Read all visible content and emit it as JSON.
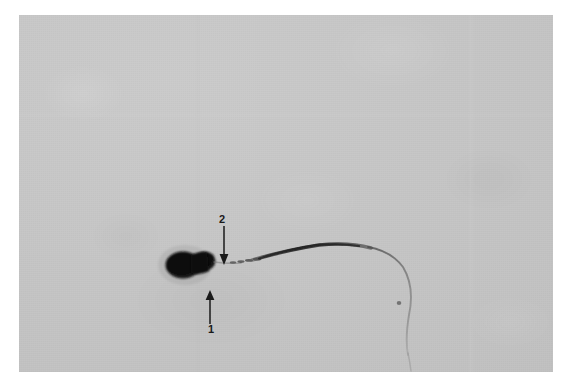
{
  "image": {
    "kind": "light-micrograph",
    "subject": "stained spermatozoon",
    "plate": {
      "left": 19,
      "top": 15,
      "width": 534,
      "height": 357,
      "background_color": "#c6c6c6",
      "page_color": "#ffffff"
    },
    "stain_color": "#111111",
    "annotation_color": "#1a1a1a"
  },
  "annotations": [
    {
      "id": "annotation-1",
      "label": "1",
      "arrow_direction": "up",
      "points_to": "sperm-head",
      "label_x": 189,
      "label_y": 309,
      "arrow_x": 184,
      "arrow_y": 275
    },
    {
      "id": "annotation-2",
      "label": "2",
      "arrow_direction": "down",
      "points_to": "sperm-midpiece",
      "label_x": 200,
      "label_y": 199,
      "arrow_x": 198,
      "arrow_y": 211
    }
  ],
  "cell": {
    "head_label": "sperm head",
    "midpiece_label": "sperm midpiece",
    "tail_label": "sperm flagellum"
  }
}
